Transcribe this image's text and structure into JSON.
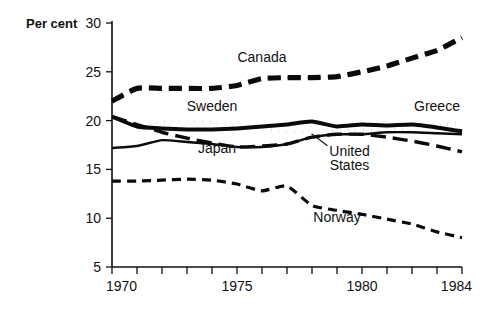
{
  "figure": {
    "yaxis_title": "Per cent",
    "background": "#ffffff",
    "ink_color": "#0b0b0b"
  },
  "axes": {
    "y_ticks": [
      "30",
      "25",
      "20",
      "15",
      "10",
      "5"
    ],
    "x_ticks_major": [
      "1970",
      "1975",
      "1980",
      "1984"
    ],
    "x_minor_count": 14
  },
  "series_labels": {
    "canada": "Canada",
    "sweden": "Sweden",
    "greece": "Greece",
    "japan": "Japan",
    "united_states": "United\nStates",
    "united_states_line1": "United",
    "united_states_line2": "States",
    "norway": "Norway"
  },
  "chart_data": {
    "type": "line",
    "title": "",
    "xlabel": "",
    "ylabel": "Per cent",
    "xlim": [
      1970,
      1984
    ],
    "ylim": [
      5,
      30
    ],
    "grid": false,
    "legend": "inline-annotations",
    "x": [
      1970,
      1971,
      1972,
      1973,
      1974,
      1975,
      1976,
      1977,
      1978,
      1979,
      1980,
      1981,
      1982,
      1983,
      1984
    ],
    "series": [
      {
        "name": "Canada",
        "style": "dashed-outline",
        "values": [
          22.0,
          23.3,
          23.3,
          23.3,
          23.3,
          23.6,
          24.3,
          24.4,
          24.4,
          24.5,
          25.0,
          25.6,
          26.4,
          27.2,
          28.5
        ]
      },
      {
        "name": "Sweden",
        "style": "double-thin",
        "values": [
          20.4,
          19.4,
          19.2,
          19.1,
          19.1,
          19.2,
          19.4,
          19.6,
          19.9,
          19.4,
          19.6,
          19.5,
          19.6,
          19.3,
          18.9
        ]
      },
      {
        "name": "Greece",
        "style": "dotted",
        "values": [
          20.4,
          19.5,
          19.9,
          20.0,
          19.8,
          19.5,
          19.2,
          18.8,
          18.8,
          18.9,
          19.0,
          19.0,
          19.2,
          19.5,
          19.8
        ]
      },
      {
        "name": "Japan",
        "style": "long-dash-thick",
        "values": [
          20.4,
          19.6,
          18.8,
          18.2,
          17.7,
          17.3,
          17.4,
          17.6,
          18.3,
          18.6,
          18.6,
          18.3,
          17.9,
          17.4,
          16.8
        ]
      },
      {
        "name": "United States",
        "style": "solid-medium",
        "values": [
          17.2,
          17.4,
          18.0,
          17.8,
          17.6,
          17.3,
          17.3,
          17.6,
          18.3,
          18.6,
          18.6,
          18.8,
          18.8,
          18.7,
          18.6
        ]
      },
      {
        "name": "Norway",
        "style": "short-dash",
        "values": [
          13.8,
          13.8,
          13.9,
          14.0,
          13.9,
          13.5,
          12.8,
          13.3,
          11.3,
          10.8,
          10.4,
          9.9,
          9.4,
          8.6,
          8.0
        ]
      }
    ],
    "annotations": [
      {
        "text": "Canada",
        "x": 1976.0,
        "y": 26.0
      },
      {
        "text": "Sweden",
        "x": 1974.0,
        "y": 21.0
      },
      {
        "text": "Greece",
        "x": 1983.0,
        "y": 21.0
      },
      {
        "text": "Japan",
        "x": 1974.2,
        "y": 16.7
      },
      {
        "text": "United States",
        "x": 1979.5,
        "y": 16.4
      },
      {
        "text": "Norway",
        "x": 1979.0,
        "y": 9.6
      }
    ]
  }
}
